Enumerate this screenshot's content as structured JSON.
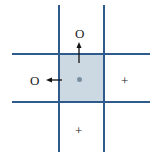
{
  "diagram": {
    "center_cell": {
      "shaded": true,
      "marker": "dot",
      "color": "#ccd9e2"
    },
    "grid_color": "#2f5a8c",
    "labels": {
      "top": "O",
      "left": "O",
      "right": "+",
      "bottom": "+"
    },
    "arrows": [
      {
        "from": "center",
        "direction": "up",
        "target": "top"
      },
      {
        "from": "center",
        "direction": "left",
        "target": "left"
      }
    ]
  }
}
